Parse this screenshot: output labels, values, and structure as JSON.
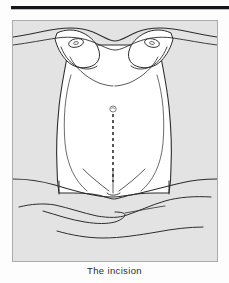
{
  "figure": {
    "caption": "The incision",
    "alt_label": "anterior abdominal wall with vertical midline surgical incision marked",
    "panel": {
      "background_color": "#e3e3e3",
      "border_color": "#a9abae",
      "skin_fill_color": "#ffffff",
      "line_color": "#2d2d2d"
    },
    "header_rule": {
      "color": "#15161a"
    },
    "parts": [
      {
        "id": "left-breast",
        "label": "left breast"
      },
      {
        "id": "right-breast",
        "label": "right breast"
      },
      {
        "id": "left-nipple",
        "label": "left nipple"
      },
      {
        "id": "right-nipple",
        "label": "right nipple"
      },
      {
        "id": "abdomen",
        "label": "abdomen"
      },
      {
        "id": "umbilicus",
        "label": "umbilicus"
      },
      {
        "id": "incision-line",
        "label": "midline vertical incision"
      },
      {
        "id": "pubic-region",
        "label": "pubic region"
      },
      {
        "id": "surgical-drape",
        "label": "surgical drape"
      }
    ],
    "incision": {
      "orientation": "vertical",
      "style": "dashed",
      "start_landmark": "umbilicus",
      "end_landmark": "pubic symphysis",
      "dash_pattern": "3 3"
    }
  }
}
